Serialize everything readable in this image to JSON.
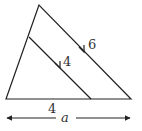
{
  "diagram": {
    "type": "triangle with parallel segment",
    "labels": {
      "outer_side": "6",
      "inner_segment": "4",
      "base_segment": "4",
      "dimension": "a"
    },
    "colors": {
      "stroke": "#222222",
      "background": "#ffffff"
    }
  }
}
